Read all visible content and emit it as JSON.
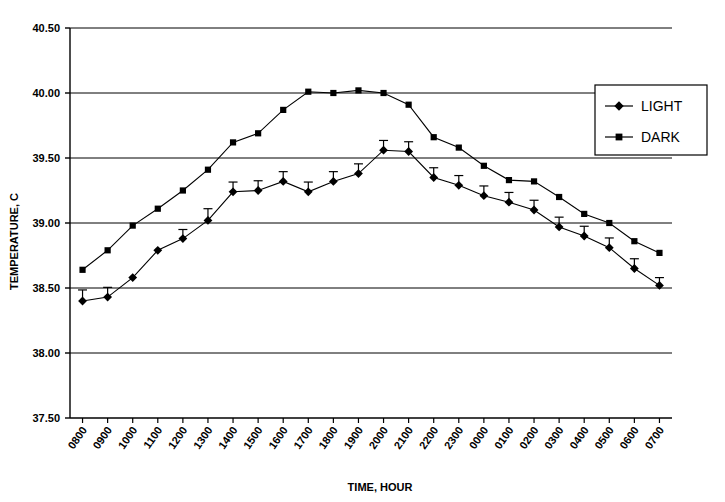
{
  "chart_data": {
    "type": "line",
    "title": "",
    "xlabel": "TIME, HOUR",
    "ylabel": "TEMPERATURE, C",
    "ylim": [
      37.5,
      40.5
    ],
    "ytick_labels": [
      "40.50",
      "40.00",
      "39.50",
      "39.00",
      "38.50",
      "38.00",
      "37.50"
    ],
    "ytick_values": [
      40.5,
      40.0,
      39.5,
      39.0,
      38.5,
      38.0,
      37.5
    ],
    "grid": true,
    "grid_axis": "y",
    "legend_position": "top-right",
    "categories": [
      "0800",
      "0900",
      "1000",
      "1100",
      "1200",
      "1300",
      "1400",
      "1500",
      "1600",
      "1700",
      "1800",
      "1900",
      "2000",
      "2100",
      "2200",
      "2300",
      "0000",
      "0100",
      "0200",
      "0300",
      "0400",
      "0500",
      "0600",
      "0700"
    ],
    "series": [
      {
        "name": "LIGHT",
        "marker": "diamond",
        "color": "#000000",
        "values": [
          38.4,
          38.43,
          38.58,
          38.79,
          38.88,
          39.02,
          39.24,
          39.25,
          39.32,
          39.24,
          39.32,
          39.38,
          39.56,
          39.55,
          39.35,
          39.29,
          39.21,
          39.16,
          39.1,
          38.97,
          38.9,
          38.81,
          38.65,
          38.52
        ],
        "errors": [
          0.085,
          0.075,
          0.0,
          0.0,
          0.07,
          0.09,
          0.075,
          0.075,
          0.075,
          0.075,
          0.075,
          0.075,
          0.075,
          0.075,
          0.075,
          0.075,
          0.075,
          0.075,
          0.075,
          0.075,
          0.075,
          0.075,
          0.075,
          0.06
        ]
      },
      {
        "name": "DARK",
        "marker": "square",
        "color": "#000000",
        "values": [
          38.64,
          38.79,
          38.98,
          39.11,
          39.25,
          39.41,
          39.62,
          39.69,
          39.87,
          40.01,
          40.0,
          40.02,
          40.0,
          39.91,
          39.66,
          39.58,
          39.44,
          39.33,
          39.32,
          39.2,
          39.07,
          39.0,
          38.86,
          38.77
        ],
        "errors": [
          0.0,
          0.0,
          0.0,
          0.0,
          0.0,
          0.0,
          0.0,
          0.0,
          0.0,
          0.0,
          0.0,
          0.0,
          0.0,
          0.0,
          0.0,
          0.0,
          0.0,
          0.0,
          0.0,
          0.0,
          0.0,
          0.0,
          0.0,
          0.0
        ]
      }
    ]
  },
  "legend": {
    "entries": [
      {
        "label": "LIGHT",
        "marker": "diamond"
      },
      {
        "label": "DARK",
        "marker": "square"
      }
    ]
  },
  "axes": {
    "y_title": "TEMPERATURE, C",
    "x_title": "TIME, HOUR"
  }
}
